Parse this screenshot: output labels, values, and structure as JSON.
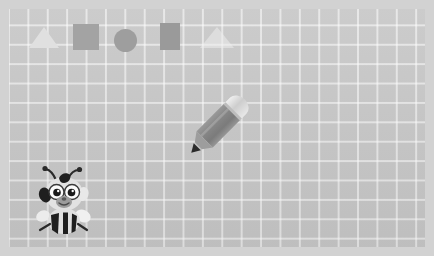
{
  "canvas": {
    "width": 434,
    "height": 256,
    "background_color": "#c6c6c6",
    "border_color": "#d2d2d2",
    "grid_line_color": "#ffffff",
    "grid_cell_px": 19,
    "description": "Grid paper drawing surface"
  },
  "shapes": [
    {
      "name": "triangle",
      "label": "triangle",
      "color": "#e0e0e0",
      "x": 29,
      "y": 27
    },
    {
      "name": "square",
      "label": "square",
      "color": "#a3a3a3",
      "x": 73,
      "y": 24
    },
    {
      "name": "circle",
      "label": "circle",
      "color": "#9e9e9e",
      "x": 114,
      "y": 29
    },
    {
      "name": "rectangle",
      "label": "rectangle",
      "color": "#9a9a9a",
      "x": 160,
      "y": 23
    },
    {
      "name": "triangle-faint",
      "label": "faint triangle",
      "color": "#ececec",
      "x": 200,
      "y": 27
    }
  ],
  "objects": {
    "pencil": {
      "label": "pencil",
      "body_color": "#8c8c8c",
      "ferrule_color": "#dcdcdc",
      "tip_color": "#2b2b2b",
      "x": 183,
      "y": 93,
      "rotation_deg": 45
    },
    "bee": {
      "label": "bee",
      "body_color": "#e8e8e8",
      "stripe_color": "#1f1f1f",
      "eye_color": "#ffffff",
      "pupil_color": "#1a1a1a",
      "x": 34,
      "y": 164
    }
  }
}
